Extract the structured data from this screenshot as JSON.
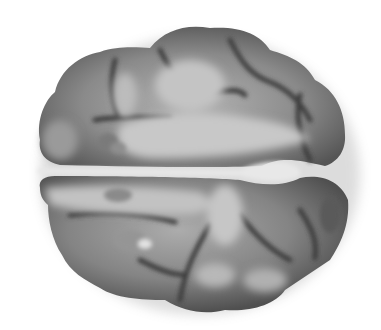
{
  "image": {
    "subject": "3D rendered brain, dorsal view",
    "description": "Grayscale surface rendering of a brain viewed from above, showing two hemispheres separated by the longitudinal fissure, with lighter highlighted activation-like patches",
    "colors": {
      "background": "#ffffff",
      "cortex_dark": "#4a4a4a",
      "cortex_mid": "#7a7a7a",
      "cortex_light": "#b8b8b8",
      "highlight": "#d8d8d8",
      "fissure": "#e6e6e6"
    }
  }
}
